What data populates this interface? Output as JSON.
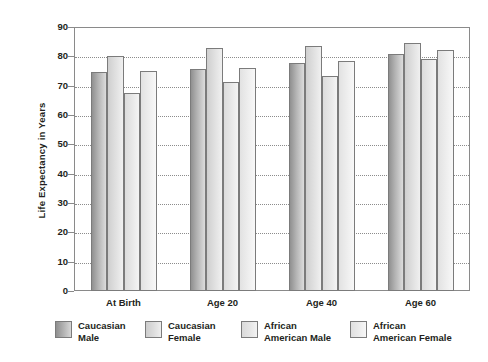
{
  "chart_data": {
    "type": "bar",
    "title": "",
    "xlabel": "",
    "ylabel": "Life Expectancy in Years",
    "categories": [
      "At Birth",
      "Age 20",
      "Age 40",
      "Age 60"
    ],
    "series": [
      {
        "name": "Caucasian\nMale",
        "values": [
          74.7,
          75.8,
          77.8,
          80.9
        ],
        "color": "#b4b4b4"
      },
      {
        "name": "Caucasian\nFemale",
        "values": [
          80.0,
          82.8,
          83.5,
          84.7
        ],
        "color": "#dedede"
      },
      {
        "name": "African\nAmerican Male",
        "values": [
          67.5,
          71.2,
          73.2,
          79.0
        ],
        "color": "#e6e6e6"
      },
      {
        "name": "African\nAmerican Female",
        "values": [
          75.0,
          76.0,
          78.5,
          82.0
        ],
        "color": "#ececec"
      }
    ],
    "ylim": [
      0,
      90
    ],
    "yticks": [
      "0",
      "10",
      "20",
      "30",
      "40",
      "50",
      "60",
      "70",
      "80",
      "90"
    ],
    "ytick_values": [
      0,
      10,
      20,
      30,
      40,
      50,
      60,
      70,
      80,
      90
    ],
    "grid": true,
    "grid_axis": "y",
    "grid_style": "dotted",
    "legend_position": "bottom",
    "plot_border_color": "#8a8a8a",
    "background": "#ffffff"
  }
}
